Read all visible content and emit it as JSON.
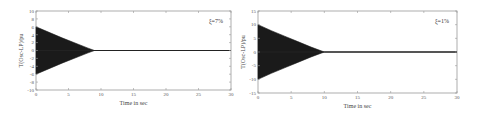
{
  "chart_data": [
    {
      "type": "line",
      "title": "",
      "annotation": "ξ=7%",
      "xlabel": "Time in sec",
      "ylabel": "T(Osc-LP)/pu",
      "xlim": [
        0,
        30
      ],
      "ylim": [
        -10,
        10
      ],
      "xticks": [
        0,
        5,
        10,
        15,
        20,
        25,
        30
      ],
      "yticks": [
        10,
        8,
        6,
        4,
        2,
        0,
        -2,
        -4,
        -6,
        -8,
        -10
      ],
      "grid": false,
      "series": [
        {
          "name": "envelope_upper",
          "x": [
            0,
            2,
            4,
            6,
            8,
            9,
            30
          ],
          "values": [
            6,
            4.6,
            3.2,
            1.9,
            0.6,
            0,
            0
          ]
        },
        {
          "name": "envelope_lower",
          "x": [
            0,
            2,
            4,
            6,
            8,
            9,
            30
          ],
          "values": [
            -6,
            -4.6,
            -3.2,
            -1.9,
            -0.6,
            0,
            0
          ]
        }
      ]
    },
    {
      "type": "line",
      "title": "",
      "annotation": "ξ=1%",
      "xlabel": "Time in sec",
      "ylabel": "T(Osc-LP)/pu",
      "xlim": [
        0,
        30
      ],
      "ylim": [
        -15,
        15
      ],
      "xticks": [
        0,
        5,
        10,
        15,
        20,
        25,
        30
      ],
      "yticks": [
        15,
        10,
        5,
        0,
        -5,
        -10,
        -15
      ],
      "grid": false,
      "series": [
        {
          "name": "envelope_upper",
          "x": [
            0,
            2,
            4,
            6,
            8,
            10,
            30
          ],
          "values": [
            10,
            7.8,
            5.8,
            3.8,
            1.8,
            0,
            0
          ]
        },
        {
          "name": "envelope_lower",
          "x": [
            0,
            2,
            4,
            6,
            8,
            10,
            30
          ],
          "values": [
            -10,
            -7.8,
            -5.8,
            -3.8,
            -1.8,
            0,
            0
          ]
        }
      ]
    }
  ]
}
